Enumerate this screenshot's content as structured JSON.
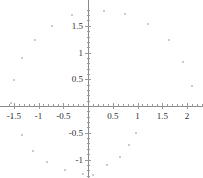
{
  "chart_data": {
    "type": "scatter",
    "title": "",
    "xlabel": "",
    "ylabel": "",
    "xlim": [
      -1.62,
      2.3
    ],
    "ylim": [
      -1.3,
      1.85
    ],
    "grid": false,
    "legend_position": "none",
    "marker_color": "#b9b9b9",
    "axis_color": "#8a8a8a",
    "xticks": [
      -1.5,
      -1,
      -0.5,
      0.5,
      1,
      1.5,
      2
    ],
    "xtick_labels": [
      "-1.5",
      "-1",
      "-0.5",
      "0.5",
      "1",
      "1.5",
      "2"
    ],
    "yticks": [
      1.5,
      1,
      0.5,
      -0.5,
      -1
    ],
    "ytick_labels": [
      "1.5",
      "1",
      "0.5",
      "-0.5",
      "-1"
    ],
    "x_minor_tick_step": 0.1,
    "y_minor_tick_step": 0.1,
    "points": [
      {
        "x": 0.32,
        "y": 1.78
      },
      {
        "x": 0.74,
        "y": 1.72
      },
      {
        "x": 1.22,
        "y": 1.53
      },
      {
        "x": 1.63,
        "y": 1.24
      },
      {
        "x": 1.92,
        "y": 0.83
      },
      {
        "x": 2.1,
        "y": 0.38
      },
      {
        "x": -0.32,
        "y": 1.7
      },
      {
        "x": -0.72,
        "y": 1.5
      },
      {
        "x": -1.07,
        "y": 1.23
      },
      {
        "x": -1.34,
        "y": 0.9
      },
      {
        "x": -1.49,
        "y": 0.48
      },
      {
        "x": -1.56,
        "y": 0.05
      },
      {
        "x": -1.53,
        "y": -0.22
      },
      {
        "x": -1.33,
        "y": -0.55
      },
      {
        "x": -1.11,
        "y": -0.84
      },
      {
        "x": -0.82,
        "y": -1.05
      },
      {
        "x": -0.46,
        "y": -1.2
      },
      {
        "x": -0.1,
        "y": -1.27
      },
      {
        "x": 0.1,
        "y": -1.28
      },
      {
        "x": 0.39,
        "y": -1.1
      },
      {
        "x": 0.65,
        "y": -0.95
      },
      {
        "x": 0.82,
        "y": -0.72
      },
      {
        "x": 0.96,
        "y": -0.5
      }
    ]
  }
}
